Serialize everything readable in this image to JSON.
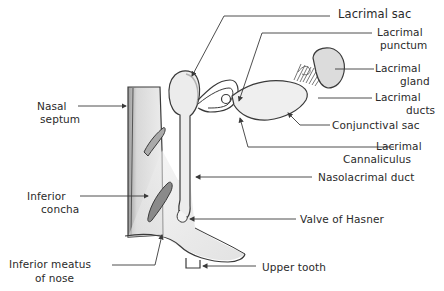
{
  "diagram": {
    "title": "",
    "style": "hand-drawn pencil sketch",
    "colors": {
      "stroke": "#3a3a3a",
      "shade": "#c8c8c8",
      "light": "#e6e6e6",
      "text": "#2a2a2a"
    },
    "labels": {
      "lacrimal_sac": "Lacrimal sac",
      "lacrimal_punctum_1": "Lacrimal",
      "lacrimal_punctum_2": "punctum",
      "lacrimal_gland_1": "Lacrimal",
      "lacrimal_gland_2": "gland",
      "lacrimal_ducts_1": "Lacrimal",
      "lacrimal_ducts_2": "ducts",
      "conjunctival_sac": "Conjunctival sac",
      "lacrimal_canaliculus_1": "Lacrimal",
      "lacrimal_canaliculus_2": "Cannaliculus",
      "nasolacrimal_duct": "Nasolacrimal duct",
      "valve_of_hasner": "Valve of Hasner",
      "upper_tooth": "Upper tooth",
      "nasal_septum_1": "Nasal",
      "nasal_septum_2": "septum",
      "inferior_concha_1": "Inferior",
      "inferior_concha_2": "concha",
      "inferior_meatus_1": "Inferior meatus",
      "inferior_meatus_2": "of nose"
    }
  }
}
